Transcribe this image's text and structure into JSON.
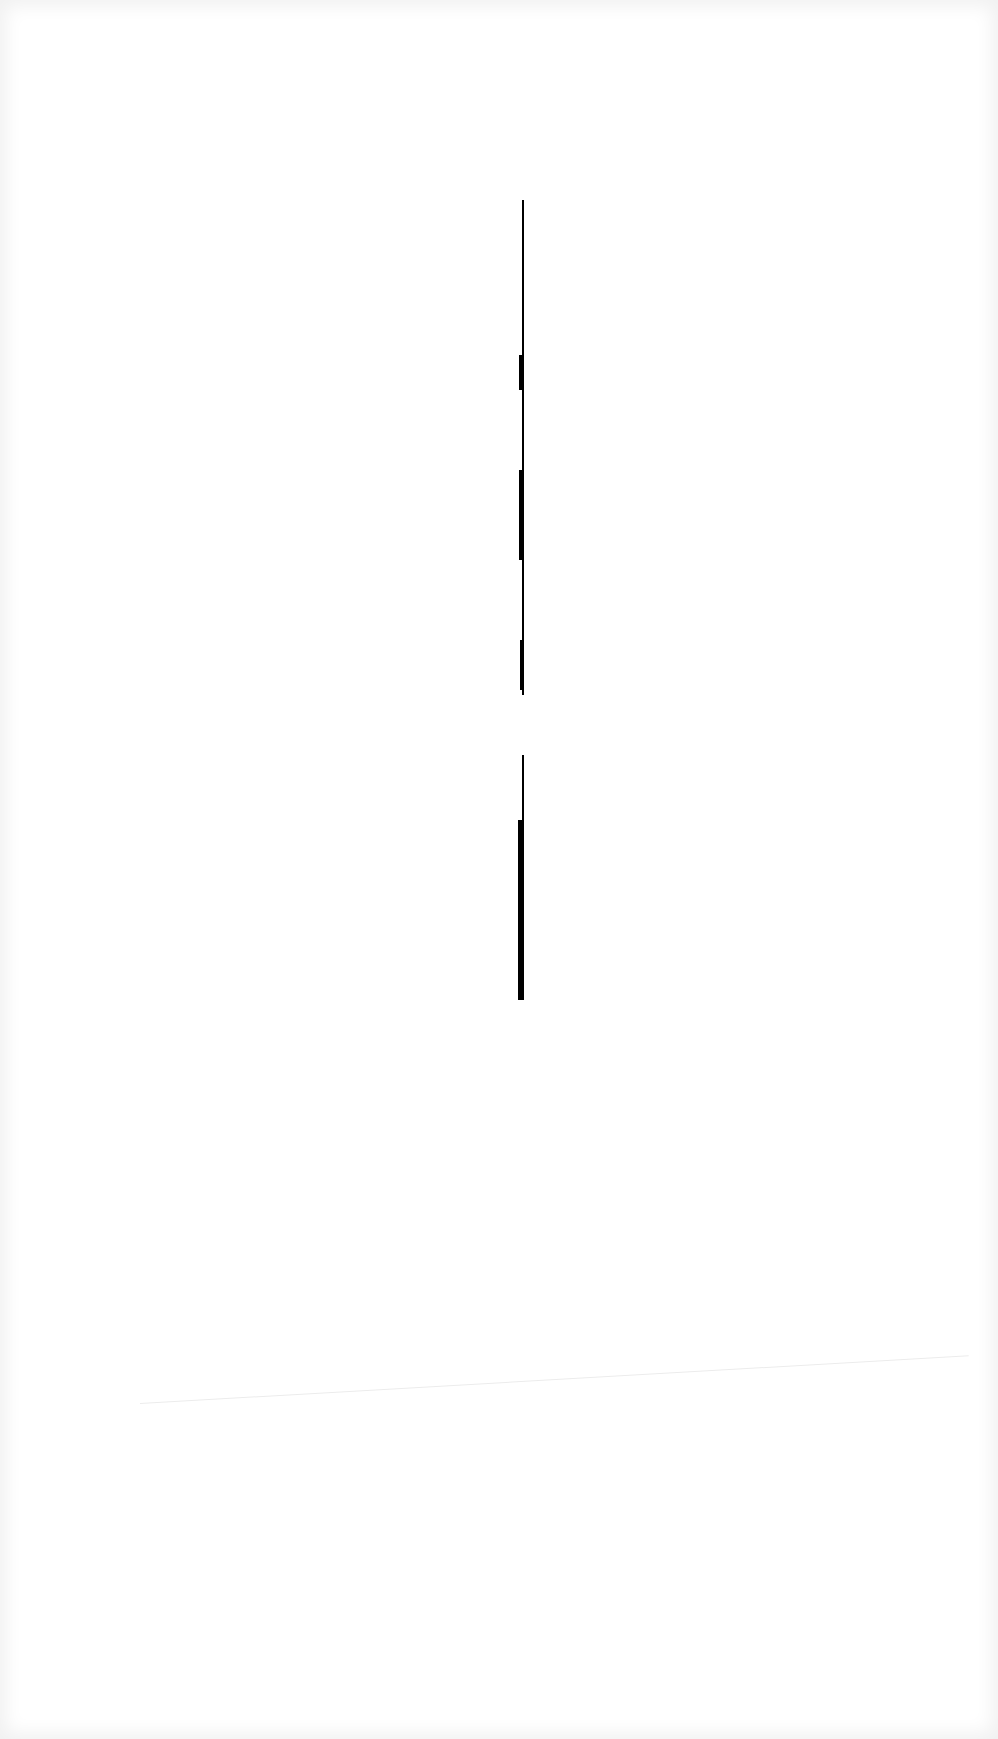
{
  "page": {
    "background": "#ffffff",
    "line_color": "#000000"
  }
}
